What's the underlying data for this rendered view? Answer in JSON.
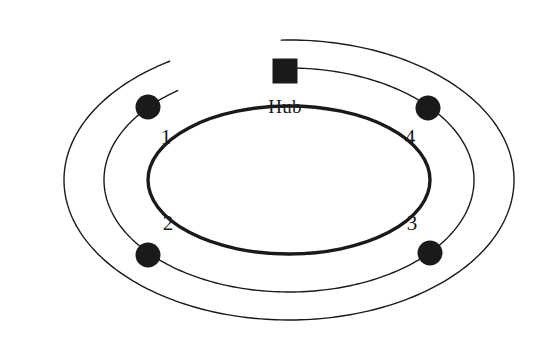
{
  "diagram": {
    "type": "network-topology-diagram",
    "background_color": "#ffffff",
    "stroke_color": "#1a1a1a",
    "canvas": {
      "width": 540,
      "height": 355
    },
    "hub": {
      "label": "Hub",
      "shape": "square",
      "fill_color": "#1a1a1a",
      "center": {
        "x": 285,
        "y": 71
      },
      "size": 25,
      "label_position": {
        "x": 285,
        "y": 97
      }
    },
    "ring": {
      "shape": "ellipse",
      "stroke_color": "#1a1a1a",
      "stroke_width": 3.4,
      "center": {
        "x": 289,
        "y": 180
      },
      "rx": 141,
      "ry": 74
    },
    "nodes": [
      {
        "label": "1",
        "fill_color": "#1a1a1a",
        "radius": 12.5,
        "cx": 148,
        "cy": 107,
        "label_x": 166,
        "label_y": 137
      },
      {
        "label": "2",
        "fill_color": "#1a1a1a",
        "radius": 12.5,
        "cx": 148,
        "cy": 255,
        "label_x": 168,
        "label_y": 223
      },
      {
        "label": "3",
        "fill_color": "#1a1a1a",
        "radius": 12.5,
        "cx": 430,
        "cy": 253,
        "label_x": 412,
        "label_y": 223
      },
      {
        "label": "4",
        "fill_color": "#1a1a1a",
        "radius": 12.5,
        "cx": 428,
        "cy": 108,
        "label_x": 410,
        "label_y": 137
      }
    ],
    "wrap_arcs": [
      {
        "name": "outer-cable-arc",
        "stroke_width": 1.4,
        "rx": 225,
        "ry": 140,
        "cx": 289,
        "cy": 180,
        "start_angle_deg": 268,
        "sweep_deg": 330
      },
      {
        "name": "inner-cable-arc",
        "stroke_width": 1.4,
        "rx": 185,
        "ry": 112,
        "cx": 289,
        "cy": 180,
        "start_angle_deg": 266,
        "sweep_deg": 327
      }
    ]
  }
}
